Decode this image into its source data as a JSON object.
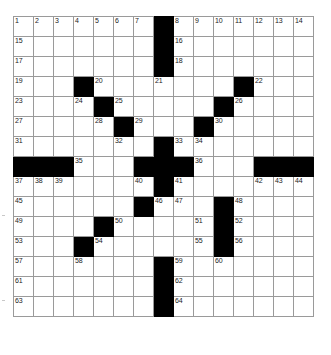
{
  "puzzle": {
    "title": "Crossword Grid",
    "rows": 15,
    "cols": 15,
    "cell_size_px": 21,
    "colors": {
      "block": "#000000",
      "cell": "#ffffff",
      "grid_line": "#9a9a9a",
      "border": "#5a5a5a",
      "number_text": "#1b1b1b"
    },
    "numbers_visible": [
      1,
      2,
      3,
      4,
      5,
      6,
      7,
      8,
      9,
      10,
      11,
      12,
      13,
      14,
      15,
      16,
      17,
      18,
      19,
      20,
      21,
      22,
      23,
      24,
      25,
      26,
      27,
      28,
      29,
      30,
      31,
      32,
      33,
      34,
      35,
      36,
      37,
      38,
      39,
      40,
      41,
      42,
      43,
      44,
      45,
      46,
      47,
      48,
      49,
      50,
      51,
      52,
      53,
      54,
      55,
      56,
      57,
      58,
      59,
      60,
      61,
      62,
      63,
      64
    ],
    "grid": [
      [
        {
          "block": false,
          "num": "1"
        },
        {
          "block": false,
          "num": "2"
        },
        {
          "block": false,
          "num": "3"
        },
        {
          "block": false,
          "num": "4"
        },
        {
          "block": false,
          "num": "5"
        },
        {
          "block": false,
          "num": "6"
        },
        {
          "block": false,
          "num": "7"
        },
        {
          "block": true,
          "num": ""
        },
        {
          "block": false,
          "num": "8"
        },
        {
          "block": false,
          "num": "9"
        },
        {
          "block": false,
          "num": "10"
        },
        {
          "block": false,
          "num": "11"
        },
        {
          "block": false,
          "num": "12"
        },
        {
          "block": false,
          "num": "13"
        },
        {
          "block": false,
          "num": "14"
        }
      ],
      [
        {
          "block": false,
          "num": "15"
        },
        {
          "block": false,
          "num": ""
        },
        {
          "block": false,
          "num": ""
        },
        {
          "block": false,
          "num": ""
        },
        {
          "block": false,
          "num": ""
        },
        {
          "block": false,
          "num": ""
        },
        {
          "block": false,
          "num": ""
        },
        {
          "block": true,
          "num": ""
        },
        {
          "block": false,
          "num": "16"
        },
        {
          "block": false,
          "num": ""
        },
        {
          "block": false,
          "num": ""
        },
        {
          "block": false,
          "num": ""
        },
        {
          "block": false,
          "num": ""
        },
        {
          "block": false,
          "num": ""
        },
        {
          "block": false,
          "num": ""
        }
      ],
      [
        {
          "block": false,
          "num": "17"
        },
        {
          "block": false,
          "num": ""
        },
        {
          "block": false,
          "num": ""
        },
        {
          "block": false,
          "num": ""
        },
        {
          "block": false,
          "num": ""
        },
        {
          "block": false,
          "num": ""
        },
        {
          "block": false,
          "num": ""
        },
        {
          "block": true,
          "num": ""
        },
        {
          "block": false,
          "num": "18"
        },
        {
          "block": false,
          "num": ""
        },
        {
          "block": false,
          "num": ""
        },
        {
          "block": false,
          "num": ""
        },
        {
          "block": false,
          "num": ""
        },
        {
          "block": false,
          "num": ""
        },
        {
          "block": false,
          "num": ""
        }
      ],
      [
        {
          "block": false,
          "num": "19"
        },
        {
          "block": false,
          "num": ""
        },
        {
          "block": false,
          "num": ""
        },
        {
          "block": true,
          "num": ""
        },
        {
          "block": false,
          "num": "20"
        },
        {
          "block": false,
          "num": ""
        },
        {
          "block": false,
          "num": ""
        },
        {
          "block": false,
          "num": "21"
        },
        {
          "block": false,
          "num": ""
        },
        {
          "block": false,
          "num": ""
        },
        {
          "block": false,
          "num": ""
        },
        {
          "block": true,
          "num": ""
        },
        {
          "block": false,
          "num": "22"
        },
        {
          "block": false,
          "num": ""
        },
        {
          "block": false,
          "num": ""
        }
      ],
      [
        {
          "block": false,
          "num": "23"
        },
        {
          "block": false,
          "num": ""
        },
        {
          "block": false,
          "num": ""
        },
        {
          "block": false,
          "num": "24"
        },
        {
          "block": true,
          "num": ""
        },
        {
          "block": false,
          "num": "25"
        },
        {
          "block": false,
          "num": ""
        },
        {
          "block": false,
          "num": ""
        },
        {
          "block": false,
          "num": ""
        },
        {
          "block": false,
          "num": ""
        },
        {
          "block": true,
          "num": ""
        },
        {
          "block": false,
          "num": "26"
        },
        {
          "block": false,
          "num": ""
        },
        {
          "block": false,
          "num": ""
        },
        {
          "block": false,
          "num": ""
        }
      ],
      [
        {
          "block": false,
          "num": "27"
        },
        {
          "block": false,
          "num": ""
        },
        {
          "block": false,
          "num": ""
        },
        {
          "block": false,
          "num": ""
        },
        {
          "block": false,
          "num": "28"
        },
        {
          "block": true,
          "num": ""
        },
        {
          "block": false,
          "num": "29"
        },
        {
          "block": false,
          "num": ""
        },
        {
          "block": false,
          "num": ""
        },
        {
          "block": true,
          "num": ""
        },
        {
          "block": false,
          "num": "30"
        },
        {
          "block": false,
          "num": ""
        },
        {
          "block": false,
          "num": ""
        },
        {
          "block": false,
          "num": ""
        },
        {
          "block": false,
          "num": ""
        }
      ],
      [
        {
          "block": false,
          "num": "31"
        },
        {
          "block": false,
          "num": ""
        },
        {
          "block": false,
          "num": ""
        },
        {
          "block": false,
          "num": ""
        },
        {
          "block": false,
          "num": ""
        },
        {
          "block": false,
          "num": "32"
        },
        {
          "block": false,
          "num": ""
        },
        {
          "block": true,
          "num": ""
        },
        {
          "block": false,
          "num": "33"
        },
        {
          "block": false,
          "num": "34"
        },
        {
          "block": false,
          "num": ""
        },
        {
          "block": false,
          "num": ""
        },
        {
          "block": false,
          "num": ""
        },
        {
          "block": false,
          "num": ""
        },
        {
          "block": false,
          "num": ""
        }
      ],
      [
        {
          "block": true,
          "num": ""
        },
        {
          "block": true,
          "num": ""
        },
        {
          "block": true,
          "num": ""
        },
        {
          "block": false,
          "num": "35"
        },
        {
          "block": false,
          "num": ""
        },
        {
          "block": false,
          "num": ""
        },
        {
          "block": true,
          "num": ""
        },
        {
          "block": true,
          "num": ""
        },
        {
          "block": true,
          "num": ""
        },
        {
          "block": false,
          "num": "36"
        },
        {
          "block": false,
          "num": ""
        },
        {
          "block": false,
          "num": ""
        },
        {
          "block": true,
          "num": ""
        },
        {
          "block": true,
          "num": ""
        },
        {
          "block": true,
          "num": ""
        }
      ],
      [
        {
          "block": false,
          "num": "37"
        },
        {
          "block": false,
          "num": "38"
        },
        {
          "block": false,
          "num": "39"
        },
        {
          "block": false,
          "num": ""
        },
        {
          "block": false,
          "num": ""
        },
        {
          "block": false,
          "num": ""
        },
        {
          "block": false,
          "num": "40"
        },
        {
          "block": true,
          "num": ""
        },
        {
          "block": false,
          "num": "41"
        },
        {
          "block": false,
          "num": ""
        },
        {
          "block": false,
          "num": ""
        },
        {
          "block": false,
          "num": ""
        },
        {
          "block": false,
          "num": "42"
        },
        {
          "block": false,
          "num": "43"
        },
        {
          "block": false,
          "num": "44"
        }
      ],
      [
        {
          "block": false,
          "num": "45"
        },
        {
          "block": false,
          "num": ""
        },
        {
          "block": false,
          "num": ""
        },
        {
          "block": false,
          "num": ""
        },
        {
          "block": false,
          "num": ""
        },
        {
          "block": false,
          "num": ""
        },
        {
          "block": true,
          "num": ""
        },
        {
          "block": false,
          "num": "46"
        },
        {
          "block": false,
          "num": "47"
        },
        {
          "block": false,
          "num": ""
        },
        {
          "block": true,
          "num": ""
        },
        {
          "block": false,
          "num": "48"
        },
        {
          "block": false,
          "num": ""
        },
        {
          "block": false,
          "num": ""
        },
        {
          "block": false,
          "num": ""
        }
      ],
      [
        {
          "block": false,
          "num": "49"
        },
        {
          "block": false,
          "num": ""
        },
        {
          "block": false,
          "num": ""
        },
        {
          "block": false,
          "num": ""
        },
        {
          "block": true,
          "num": ""
        },
        {
          "block": false,
          "num": "50"
        },
        {
          "block": false,
          "num": ""
        },
        {
          "block": false,
          "num": ""
        },
        {
          "block": false,
          "num": ""
        },
        {
          "block": false,
          "num": "51"
        },
        {
          "block": true,
          "num": ""
        },
        {
          "block": false,
          "num": "52"
        },
        {
          "block": false,
          "num": ""
        },
        {
          "block": false,
          "num": ""
        },
        {
          "block": false,
          "num": ""
        }
      ],
      [
        {
          "block": false,
          "num": "53"
        },
        {
          "block": false,
          "num": ""
        },
        {
          "block": false,
          "num": ""
        },
        {
          "block": true,
          "num": ""
        },
        {
          "block": false,
          "num": "54"
        },
        {
          "block": false,
          "num": ""
        },
        {
          "block": false,
          "num": ""
        },
        {
          "block": false,
          "num": ""
        },
        {
          "block": false,
          "num": ""
        },
        {
          "block": false,
          "num": "55"
        },
        {
          "block": true,
          "num": ""
        },
        {
          "block": false,
          "num": "56"
        },
        {
          "block": false,
          "num": ""
        },
        {
          "block": false,
          "num": ""
        },
        {
          "block": false,
          "num": ""
        }
      ],
      [
        {
          "block": false,
          "num": "57"
        },
        {
          "block": false,
          "num": ""
        },
        {
          "block": false,
          "num": ""
        },
        {
          "block": false,
          "num": "58"
        },
        {
          "block": false,
          "num": ""
        },
        {
          "block": false,
          "num": ""
        },
        {
          "block": false,
          "num": ""
        },
        {
          "block": true,
          "num": ""
        },
        {
          "block": false,
          "num": "59"
        },
        {
          "block": false,
          "num": ""
        },
        {
          "block": false,
          "num": "60"
        },
        {
          "block": false,
          "num": ""
        },
        {
          "block": false,
          "num": ""
        },
        {
          "block": false,
          "num": ""
        },
        {
          "block": false,
          "num": ""
        }
      ],
      [
        {
          "block": false,
          "num": "61"
        },
        {
          "block": false,
          "num": ""
        },
        {
          "block": false,
          "num": ""
        },
        {
          "block": false,
          "num": ""
        },
        {
          "block": false,
          "num": ""
        },
        {
          "block": false,
          "num": ""
        },
        {
          "block": false,
          "num": ""
        },
        {
          "block": true,
          "num": ""
        },
        {
          "block": false,
          "num": "62"
        },
        {
          "block": false,
          "num": ""
        },
        {
          "block": false,
          "num": ""
        },
        {
          "block": false,
          "num": ""
        },
        {
          "block": false,
          "num": ""
        },
        {
          "block": false,
          "num": ""
        },
        {
          "block": false,
          "num": ""
        }
      ],
      [
        {
          "block": false,
          "num": "63"
        },
        {
          "block": false,
          "num": ""
        },
        {
          "block": false,
          "num": ""
        },
        {
          "block": false,
          "num": ""
        },
        {
          "block": false,
          "num": ""
        },
        {
          "block": false,
          "num": ""
        },
        {
          "block": false,
          "num": ""
        },
        {
          "block": true,
          "num": ""
        },
        {
          "block": false,
          "num": "64"
        },
        {
          "block": false,
          "num": ""
        },
        {
          "block": false,
          "num": ""
        },
        {
          "block": false,
          "num": ""
        },
        {
          "block": false,
          "num": ""
        },
        {
          "block": false,
          "num": ""
        },
        {
          "block": false,
          "num": ""
        }
      ]
    ]
  }
}
